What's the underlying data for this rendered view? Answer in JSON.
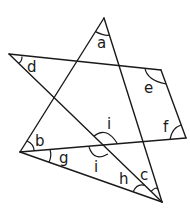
{
  "diagram": {
    "title": "",
    "stroke_color": "#1a1a1a",
    "background": "#ffffff",
    "vertices": {
      "A": [
        104,
        18
      ],
      "D": [
        9,
        54
      ],
      "E": [
        161,
        70
      ],
      "F": [
        186,
        138
      ],
      "B": [
        20,
        152
      ],
      "C": [
        162,
        202
      ]
    },
    "segments": [
      {
        "from": "A",
        "to": "B"
      },
      {
        "from": "A",
        "to": "C"
      },
      {
        "from": "D",
        "to": "E"
      },
      {
        "from": "E",
        "to": "F"
      },
      {
        "from": "F",
        "to": "B"
      },
      {
        "from": "B",
        "to": "C"
      },
      {
        "from": "D",
        "to": "C"
      }
    ],
    "angle_labels": [
      {
        "id": "a",
        "text": "a",
        "x": 97,
        "y": 48
      },
      {
        "id": "d",
        "text": "d",
        "x": 27,
        "y": 72
      },
      {
        "id": "e",
        "text": "e",
        "x": 144,
        "y": 93
      },
      {
        "id": "f",
        "text": "f",
        "x": 163,
        "y": 132
      },
      {
        "id": "b",
        "text": "b",
        "x": 35,
        "y": 146
      },
      {
        "id": "g",
        "text": "g",
        "x": 59,
        "y": 163
      },
      {
        "id": "i_top",
        "text": "i",
        "x": 107,
        "y": 129
      },
      {
        "id": "i_bottom",
        "text": "i",
        "x": 94,
        "y": 172
      },
      {
        "id": "h",
        "text": "h",
        "x": 119,
        "y": 184
      },
      {
        "id": "c",
        "text": "c",
        "x": 140,
        "y": 180
      }
    ]
  }
}
